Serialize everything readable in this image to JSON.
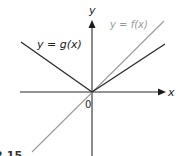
{
  "figure": {
    "axes": {
      "x_label": "x",
      "y_label": "y",
      "origin_label": "0"
    },
    "curves": [
      {
        "id": "f",
        "label": "y = f(x)",
        "color": "#9a9a9a",
        "description": "straight line through origin, slope 1"
      },
      {
        "id": "g",
        "label": "y = g(x)",
        "color": "#2a2a2a",
        "description": "V-shaped piecewise linear through origin"
      }
    ],
    "caption_fragment": "2.15"
  }
}
